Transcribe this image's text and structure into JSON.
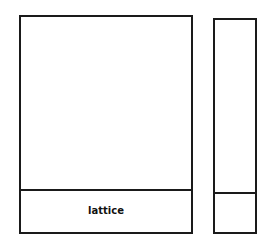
{
  "diagram": {
    "panels": [
      {
        "id": "main-panel",
        "bottom_section_label": "lattice"
      },
      {
        "id": "side-panel",
        "bottom_section_label": ""
      }
    ],
    "stroke_color": "#1a1a1a",
    "background": "#ffffff"
  }
}
